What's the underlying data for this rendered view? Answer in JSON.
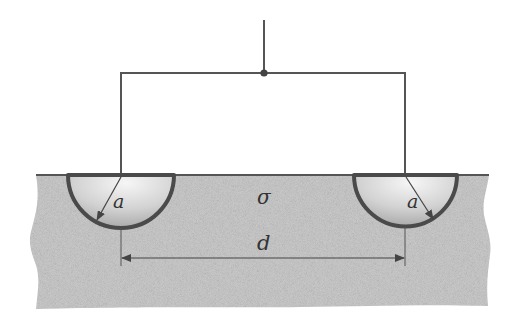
{
  "figure": {
    "labels": {
      "conductivity": "σ",
      "radius_left": "a",
      "radius_right": "a",
      "separation": "d"
    },
    "colors": {
      "wire": "#555555",
      "electrode_rim": "#4a4a4a",
      "ground_fill": "#c9c9c9",
      "electrode_fill_light": "#f4f4f4",
      "electrode_fill_dark": "#a8a8a8",
      "surface_line": "#555555"
    }
  }
}
